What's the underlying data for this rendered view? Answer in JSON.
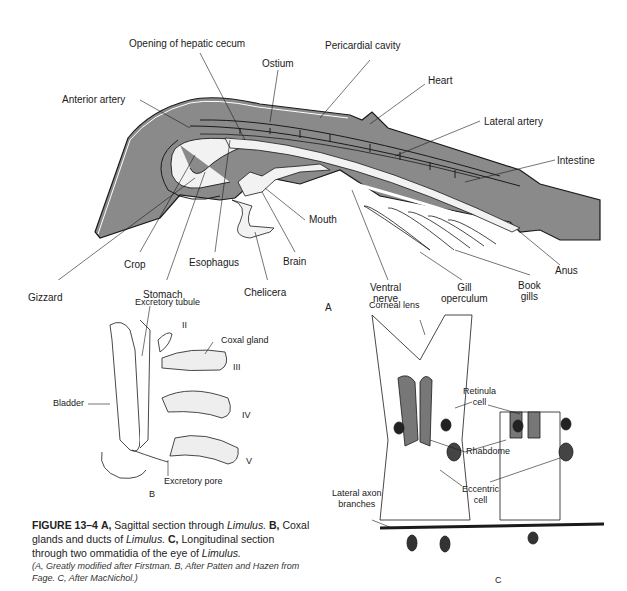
{
  "figure": {
    "panel_a": {
      "letter": "A",
      "labels": {
        "opening_hepatic_cecum": "Opening of hepatic cecum",
        "pericardial_cavity": "Pericardial cavity",
        "ostium": "Ostium",
        "heart": "Heart",
        "anterior_artery": "Anterior artery",
        "lateral_artery": "Lateral artery",
        "intestine": "Intestine",
        "mouth": "Mouth",
        "crop": "Crop",
        "esophagus": "Esophagus",
        "brain": "Brain",
        "gizzard": "Gizzard",
        "stomach": "Stomach",
        "chelicera": "Chelicera",
        "ventral_nerve_1": "Ventral",
        "ventral_nerve_2": "nerve",
        "gill_operculum_1": "Gill",
        "gill_operculum_2": "operculum",
        "book_gills_1": "Book",
        "book_gills_2": "gills",
        "anus": "Anus"
      }
    },
    "panel_b": {
      "letter": "B",
      "labels": {
        "excretory_tubule": "Excretory tubule",
        "coxal_gland": "Coxal gland",
        "bladder": "Bladder",
        "excretory_pore": "Excretory pore",
        "numeral_ii": "II",
        "numeral_iii": "III",
        "numeral_iv": "IV",
        "numeral_v": "V"
      }
    },
    "panel_c": {
      "letter": "C",
      "labels": {
        "corneal_lens": "Corneal lens",
        "retinula_cell_1": "Retinula",
        "retinula_cell_2": "cell",
        "rhabdome": "Rhabdome",
        "eccentric_cell_1": "Eccentric",
        "eccentric_cell_2": "cell",
        "lateral_axon_1": "Lateral axon",
        "lateral_axon_2": "branches"
      }
    },
    "caption": {
      "fig_num": "FIGURE 13–4",
      "a_tag": "A,",
      "a_text": "Sagittal section through",
      "a_genus": "Limulus.",
      "b_tag": "B,",
      "b_text": "Coxal glands and ducts of",
      "b_genus": "Limulus.",
      "c_tag": "C,",
      "c_text": "Longitudinal section through two ommatidia of the eye of",
      "c_genus": "Limulus.",
      "credit": "(A, Greatly modified after Firstman. B, After Patten and Hazen from Fage. C, After MacNichol.)"
    },
    "colors": {
      "body_fill": "#8a8a8a",
      "organ_fill": "#f2f2f2",
      "line": "#1a1a1a",
      "stipple": "#e8e8e8"
    }
  }
}
